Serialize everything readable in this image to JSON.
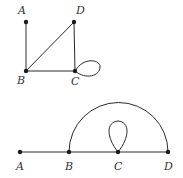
{
  "diagram": {
    "title": "",
    "graphs": [
      {
        "id": "graph-1",
        "vertices": [
          {
            "name": "A",
            "label": "A",
            "x": 26,
            "y": 22,
            "lx": 18,
            "ly": 14
          },
          {
            "name": "D",
            "label": "D",
            "x": 74,
            "y": 22,
            "lx": 76,
            "ly": 14
          },
          {
            "name": "B",
            "label": "B",
            "x": 26,
            "y": 71,
            "lx": 17,
            "ly": 84
          },
          {
            "name": "C",
            "label": "C",
            "x": 75,
            "y": 71,
            "lx": 71,
            "ly": 85
          }
        ],
        "edges": [
          {
            "from": "A",
            "to": "B"
          },
          {
            "from": "B",
            "to": "D"
          },
          {
            "from": "D",
            "to": "C"
          },
          {
            "from": "B",
            "to": "C"
          },
          {
            "from": "C",
            "to": "C",
            "type": "loop",
            "direction": "right"
          }
        ]
      },
      {
        "id": "graph-2",
        "vertices": [
          {
            "name": "A",
            "label": "A",
            "x": 20,
            "y": 152,
            "lx": 16,
            "ly": 170
          },
          {
            "name": "B",
            "label": "B",
            "x": 69,
            "y": 152,
            "lx": 65,
            "ly": 170
          },
          {
            "name": "C",
            "label": "C",
            "x": 118,
            "y": 152,
            "lx": 114,
            "ly": 170
          },
          {
            "name": "D",
            "label": "D",
            "x": 168,
            "y": 152,
            "lx": 164,
            "ly": 170
          }
        ],
        "edges": [
          {
            "from": "A",
            "to": "B"
          },
          {
            "from": "B",
            "to": "C"
          },
          {
            "from": "C",
            "to": "D"
          },
          {
            "from": "B",
            "to": "D",
            "type": "arc"
          },
          {
            "from": "C",
            "to": "C",
            "type": "loop",
            "direction": "up"
          }
        ]
      }
    ]
  }
}
